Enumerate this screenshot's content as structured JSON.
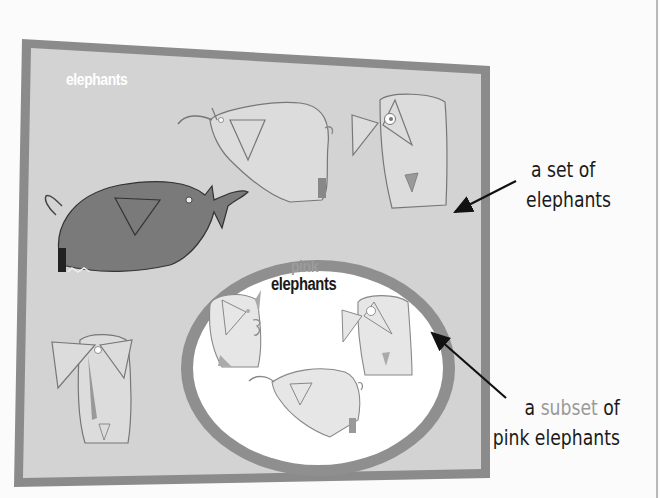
{
  "diagram": {
    "type": "set-subset illustration",
    "outer_set": {
      "label": "elephants",
      "shape": "skewed rectangle",
      "fill": "#d4d4d4",
      "border": "#8a8a8a",
      "members": [
        "grey elephant facing right (trunk raised)",
        "light elephant facing left (trunk raised)",
        "light elephant facing front (large eye)",
        "light elephant facing front (bottom-left)"
      ]
    },
    "inner_set": {
      "label_line1": "pink",
      "label_line2": "elephants",
      "shape": "ellipse",
      "fill": "#ffffff",
      "border": "#8e8e8e",
      "members": [
        "elephant facing right with curled trunk",
        "elephant facing front with large eye",
        "elephant facing left with raised trunk"
      ]
    },
    "annotations": [
      {
        "id": "set",
        "line1": "a set of",
        "line2": "elephants",
        "arrow_target": "outer set"
      },
      {
        "id": "subset",
        "line1_prefix": "a ",
        "line1_highlight": "subset",
        "line1_suffix": " of",
        "line2": "pink elephants",
        "arrow_target": "inner set"
      }
    ]
  }
}
